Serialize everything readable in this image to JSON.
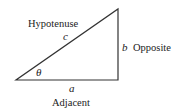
{
  "diagram": {
    "type": "right-triangle",
    "vertices": {
      "angle_vertex": [
        16,
        80
      ],
      "right_angle_vertex": [
        118,
        80
      ],
      "top_vertex": [
        118,
        9
      ]
    },
    "stroke_color": "#333333",
    "sides": {
      "hypotenuse": {
        "symbol": "c",
        "name": "Hypotenuse"
      },
      "opposite": {
        "symbol": "b",
        "name": "Opposite"
      },
      "adjacent": {
        "symbol": "a",
        "name": "Adjacent"
      }
    },
    "angle": {
      "symbol": "θ"
    }
  }
}
